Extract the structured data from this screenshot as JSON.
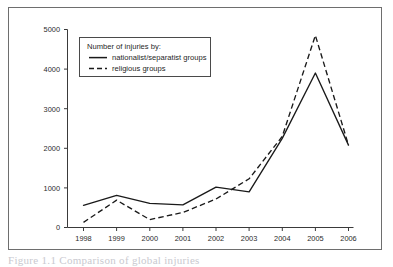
{
  "figure": {
    "caption_fragment": "Figure 1.1 Comparison of global injuries"
  },
  "legend": {
    "title": "Number of injuries by:",
    "entries": [
      {
        "label": "nationalist/separatist groups",
        "style": "solid"
      },
      {
        "label": "religious groups",
        "style": "dashed"
      }
    ]
  },
  "axes": {
    "y_ticks": [
      "0",
      "1000",
      "2000",
      "3000",
      "4000",
      "5000"
    ],
    "x_ticks": [
      "1998",
      "1999",
      "2000",
      "2001",
      "2002",
      "2003",
      "2004",
      "2005",
      "2006"
    ]
  },
  "colors": {
    "frame": "#6e6e6e",
    "axis": "#3a3a3a",
    "line": "#1a1a1a",
    "background": "#ffffff"
  },
  "chart_data": {
    "type": "line",
    "title": "",
    "xlabel": "",
    "ylabel": "",
    "legend_title": "Number of injuries by:",
    "legend_position": "upper-left-inside",
    "grid": false,
    "x": [
      "1998",
      "1999",
      "2000",
      "2001",
      "2002",
      "2003",
      "2004",
      "2005",
      "2006"
    ],
    "xlim": [
      "1998",
      "2006"
    ],
    "ylim": [
      0,
      5000
    ],
    "yticks": [
      0,
      1000,
      2000,
      3000,
      4000,
      5000
    ],
    "series": [
      {
        "name": "nationalist/separatist groups",
        "style": "solid",
        "values": [
          560,
          810,
          610,
          570,
          1020,
          900,
          2250,
          3900,
          2080
        ]
      },
      {
        "name": "religious groups",
        "style": "dashed",
        "values": [
          130,
          690,
          200,
          380,
          720,
          1230,
          2300,
          4850,
          2080
        ]
      }
    ]
  }
}
